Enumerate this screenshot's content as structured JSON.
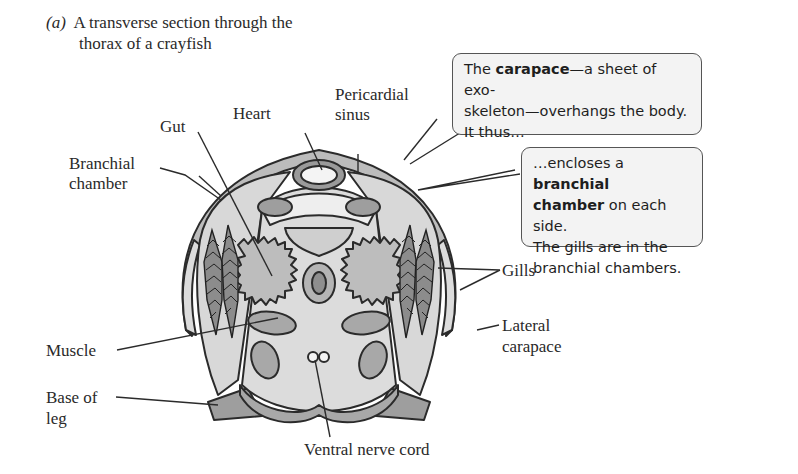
{
  "figure": {
    "panel_letter": "(a)",
    "caption_line1": "A transverse section through the",
    "caption_line2": "thorax of a crayfish"
  },
  "labels": {
    "gut": "Gut",
    "heart": "Heart",
    "pericardial_sinus_1": "Pericardial",
    "pericardial_sinus_2": "sinus",
    "branchial_chamber_1": "Branchial",
    "branchial_chamber_2": "chamber",
    "gills": "Gills",
    "lateral_carapace_1": "Lateral",
    "lateral_carapace_2": "carapace",
    "muscle": "Muscle",
    "base_of_leg_1": "Base of",
    "base_of_leg_2": "leg",
    "ventral_nerve_cord": "Ventral nerve cord"
  },
  "callouts": {
    "carapace": {
      "pre": "The ",
      "bold": "carapace",
      "post1": "—a sheet of exo-",
      "line2": "skeleton—overhangs the body.",
      "line3": "It thus…"
    },
    "branchial": {
      "pre": "…encloses a ",
      "bold1": "branchial",
      "bold2": "chamber",
      "post2": " on each side.",
      "line3": "The gills are in the",
      "line4": "branchial chambers."
    }
  },
  "colors": {
    "outline": "#2b2b2b",
    "light_fill": "#dcdcdc",
    "mid_fill": "#b4b4b4",
    "dark_fill": "#9a9a9a",
    "callout_bg": "#f3f3f3"
  }
}
